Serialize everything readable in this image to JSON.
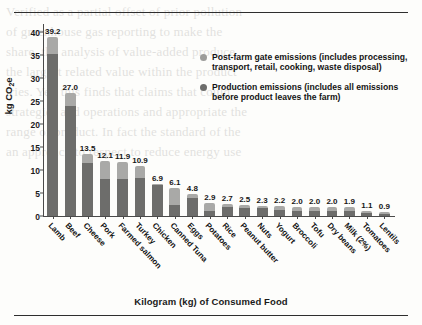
{
  "figure": {
    "y_axis_label": "kg CO",
    "y_axis_label_sub": "2",
    "y_axis_label_tail": "e",
    "x_axis_title": "Kilogram (kg) of Consumed Food"
  },
  "legend": {
    "items": [
      {
        "key": "post-farm",
        "color": "#9c9c9a",
        "label": "Post-farm gate emissions (includes processing, transport, retail, cooking, waste disposal)"
      },
      {
        "key": "production",
        "color": "#6d6d6b",
        "label": "Production emissions (includes all emissions before product leaves the farm)"
      }
    ]
  },
  "chart_data": {
    "type": "bar",
    "title": "",
    "xlabel": "Kilogram (kg) of Consumed Food",
    "ylabel": "kg CO2e",
    "ylim": [
      0,
      42
    ],
    "yticks": [
      0,
      5,
      10,
      15,
      20,
      25,
      30,
      35,
      40
    ],
    "grid": false,
    "stacked": true,
    "legend_position": "upper-right",
    "categories": [
      "Lamb",
      "Beef",
      "Cheese",
      "Pork",
      "Farmed salmon",
      "Turkey",
      "Chicken",
      "Canned Tuna",
      "Eggs",
      "Potatoes",
      "Rice",
      "Peanut butter",
      "Nuts",
      "Yogurt",
      "Broccoli",
      "Tofu",
      "Dry beans",
      "Milk (2%)",
      "Tomatoes",
      "Lentils"
    ],
    "totals": [
      39.2,
      27.0,
      13.5,
      12.1,
      11.9,
      10.9,
      6.9,
      6.1,
      4.8,
      2.9,
      2.7,
      2.5,
      2.3,
      2.2,
      2.0,
      2.0,
      2.0,
      1.9,
      1.1,
      0.9
    ],
    "series": [
      {
        "name": "Production emissions (includes all emissions before product leaves the farm)",
        "color": "#6d6d6b",
        "values": [
          35.5,
          24.0,
          11.7,
          8.2,
          8.2,
          8.3,
          6.7,
          2.4,
          4.0,
          1.2,
          2.0,
          1.7,
          1.7,
          1.3,
          1.1,
          1.1,
          1.2,
          1.2,
          0.6,
          0.5
        ]
      },
      {
        "name": "Post-farm gate emissions (includes processing, transport, retail, cooking, waste disposal)",
        "color": "#a9a9a7",
        "values": [
          3.7,
          3.0,
          1.8,
          3.9,
          3.7,
          2.6,
          0.2,
          3.7,
          0.8,
          1.7,
          0.7,
          0.8,
          0.6,
          0.9,
          0.9,
          0.9,
          0.8,
          0.7,
          0.5,
          0.4
        ]
      }
    ],
    "data_labels": [
      "39.2",
      "27.0",
      "13.5",
      "12.1",
      "11.9",
      "10.9",
      "6.9",
      "6.1",
      "4.8",
      "2.9",
      "2.7",
      "2.5",
      "2.3",
      "2.2",
      "2.0",
      "2.0",
      "2.0",
      "1.9",
      "1.1",
      "0.9"
    ]
  }
}
